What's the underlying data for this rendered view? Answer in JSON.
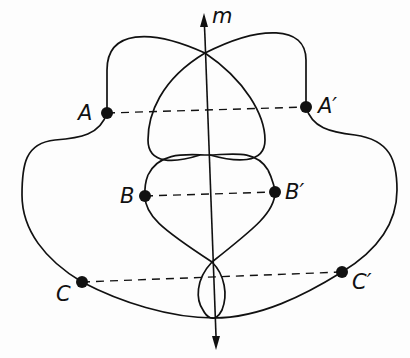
{
  "diagram": {
    "axis_label": "m",
    "points": [
      {
        "label": "A",
        "x": 107,
        "y": 113
      },
      {
        "label": "A′",
        "x": 306,
        "y": 107
      },
      {
        "label": "B",
        "x": 145,
        "y": 196
      },
      {
        "label": "B′",
        "x": 275,
        "y": 192
      },
      {
        "label": "C",
        "x": 82,
        "y": 282
      },
      {
        "label": "C′",
        "x": 342,
        "y": 272
      }
    ],
    "pairs": [
      [
        "A",
        "A′"
      ],
      [
        "B",
        "B′"
      ],
      [
        "C",
        "C′"
      ]
    ],
    "stroke_color": "#111111",
    "background_color": "#fdfdfd"
  }
}
